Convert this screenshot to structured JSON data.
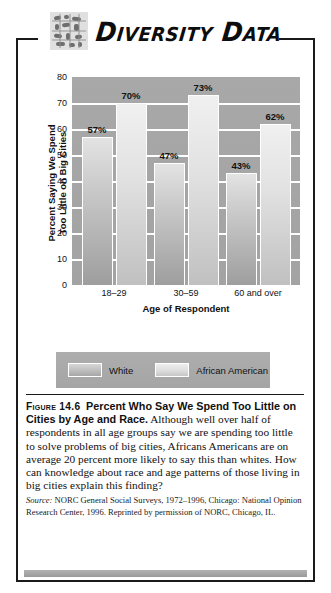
{
  "header": {
    "title": "Diversity Data",
    "icon": "diversity-grid-icon"
  },
  "chart_data": {
    "type": "bar",
    "title": "",
    "xlabel": "Age of Respondent",
    "ylabel_line1": "Percent Saying We Spend",
    "ylabel_line2": "Too Little on Big Cities",
    "categories": [
      "18–29",
      "30–59",
      "60 and over"
    ],
    "series": [
      {
        "name": "White",
        "values": [
          57,
          70,
          47
        ],
        "color": "#bdbdbd"
      },
      {
        "name": "African American",
        "values": [
          70,
          73,
          62
        ],
        "color": "#dddddd"
      }
    ],
    "grouped_values": [
      {
        "category": "18–29",
        "white": 57,
        "african_american": 70
      },
      {
        "category": "30–59",
        "white": 47,
        "african_american": 73
      },
      {
        "category": "60 and over",
        "white": 43,
        "african_american": 62
      }
    ],
    "bars": [
      {
        "group": "18–29",
        "series": "White",
        "value": 57,
        "label": "57%"
      },
      {
        "group": "18–29",
        "series": "African American",
        "value": 70,
        "label": "70%"
      },
      {
        "group": "30–59",
        "series": "White",
        "value": 47,
        "label": "47%"
      },
      {
        "group": "30–59",
        "series": "African American",
        "value": 73,
        "label": "73%"
      },
      {
        "group": "60 and over",
        "series": "White",
        "value": 43,
        "label": "43%"
      },
      {
        "group": "60 and over",
        "series": "African American",
        "value": 62,
        "label": "62%"
      }
    ],
    "ylim": [
      0,
      80
    ],
    "yticks": [
      0,
      10,
      20,
      30,
      40,
      50,
      60,
      70,
      80
    ],
    "ytick_labels": [
      "0",
      "10",
      "20",
      "30",
      "40",
      "50",
      "60",
      "70",
      "80"
    ],
    "grid": true,
    "grid_axis": "y",
    "legend_position": "bottom",
    "legend_entries": [
      "White",
      "African American"
    ],
    "plot_background": "#a5a5a5",
    "gridline_color": "#ffffff"
  },
  "legend": {
    "white_label": "White",
    "african_american_label": "African American"
  },
  "caption": {
    "figure_number": "Figure 14.6",
    "title": "Percent Who Say We Spend Too Little on Cities by Age and Race.",
    "body": " Although well over half of respondents in all age groups say we are spending too little to solve problems of big cities, Africans Americans are on average 20 percent more likely to say this than whites. How can knowledge about race and age patterns of those living in big cities explain this finding?",
    "source_label": "Source:",
    "source_text": " NORC General Social Surveys, 1972–1996, Chicago: National Opinion Research Center, 1996. Reprinted by permission of NORC, Chicago, IL."
  }
}
